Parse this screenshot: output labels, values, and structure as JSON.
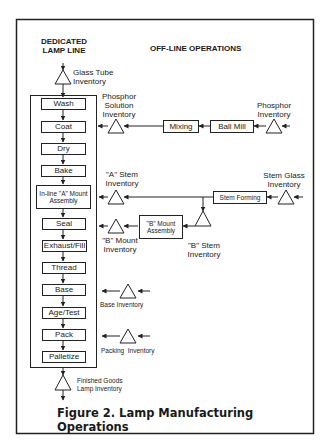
{
  "headers": {
    "dedicated_line": "DEDICATED\nLAMP LINE",
    "dedicated_line_1": "DEDICATED",
    "dedicated_line_2": "LAMP LINE",
    "offline": "OFF-LINE OPERATIONS"
  },
  "main_line_steps": [
    {
      "label": "Wash"
    },
    {
      "label": "Coat"
    },
    {
      "label": "Dry"
    },
    {
      "label": "Bake"
    },
    {
      "label": "In-line \"A\" Mount Assembly"
    },
    {
      "label": "Seal"
    },
    {
      "label": "Exhaust/Fill"
    },
    {
      "label": "Thread"
    },
    {
      "label": "Base"
    },
    {
      "label": "Age/Test"
    },
    {
      "label": "Pack"
    },
    {
      "label": "Palletize"
    }
  ],
  "offline_processes": {
    "mixing": "Mixing",
    "ball_mill": "Ball Mill",
    "stem_forming": "Stem Forming",
    "b_mount_assembly": "\"B\" Mount Assembly"
  },
  "inventories": {
    "glass_tube_1": "Glass Tube",
    "glass_tube_2": "Inventory",
    "phosphor_solution_1": "Phosphor",
    "phosphor_solution_2": "Solution",
    "phosphor_solution_3": "Inventory",
    "phosphor_1": "Phosphor",
    "phosphor_2": "Inventory",
    "a_stem_1": "\"A\" Stem",
    "a_stem_2": "Inventory",
    "stem_glass_1": "Stem Glass",
    "stem_glass_2": "Inventory",
    "b_mount_1": "\"B\" Mount",
    "b_mount_2": "Inventory",
    "b_stem_1": "\"B\" Stem",
    "b_stem_2": "Inventory",
    "base": "Base Inventory",
    "packing": "Packing  Inventory",
    "finished_goods_1": "Finished Goods",
    "finished_goods_2": "Lamp Inventory"
  },
  "caption": "Figure 2. Lamp Manufacturing Operations"
}
